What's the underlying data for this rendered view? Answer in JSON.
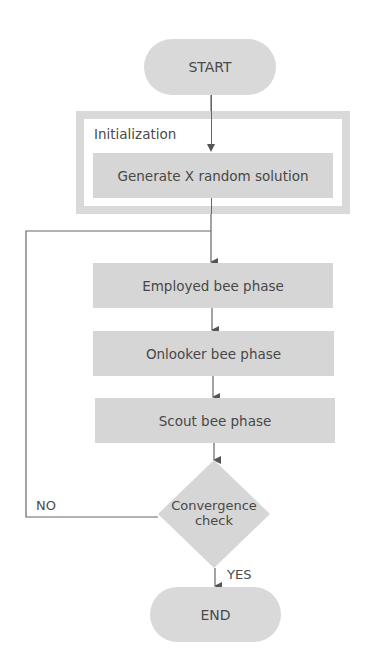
{
  "flowchart": {
    "start": {
      "label": "START"
    },
    "initialization": {
      "group_label": "Initialization",
      "step": "Generate X random solution"
    },
    "steps": [
      {
        "label": "Employed bee phase"
      },
      {
        "label": "Onlooker bee phase"
      },
      {
        "label": "Scout bee phase"
      }
    ],
    "decision": {
      "line1": "Convergence",
      "line2": "check"
    },
    "branches": {
      "no": "NO",
      "yes": "YES"
    },
    "end": {
      "label": "END"
    }
  },
  "colors": {
    "node_fill": "#d6d6d6",
    "frame": "#d9d9d9",
    "line": "#555555",
    "text": "#484848"
  }
}
